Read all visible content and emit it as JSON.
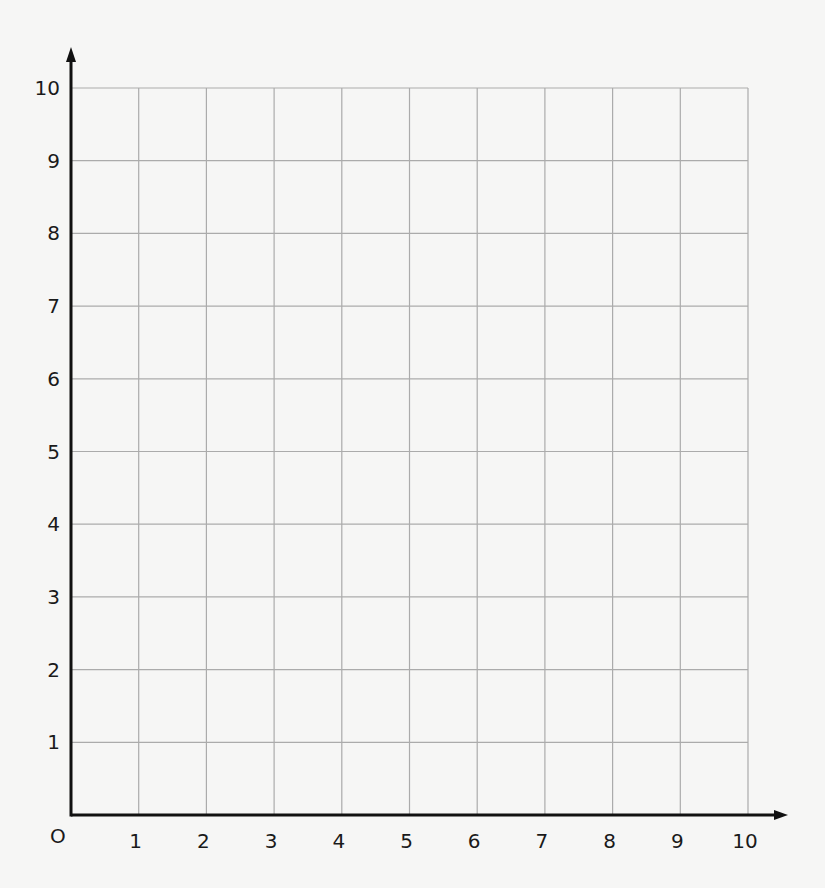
{
  "chart_data": {
    "type": "scatter",
    "title": "",
    "xlabel": "",
    "ylabel": "",
    "origin_label": "O",
    "xlim": [
      0,
      10
    ],
    "ylim": [
      0,
      10
    ],
    "grid": true,
    "x_ticks": [
      "1",
      "2",
      "3",
      "4",
      "5",
      "6",
      "7",
      "8",
      "9",
      "10"
    ],
    "y_ticks": [
      "1",
      "2",
      "3",
      "4",
      "5",
      "6",
      "7",
      "8",
      "9",
      "10"
    ],
    "series": [],
    "legend": null
  },
  "colors": {
    "background": "#f6f6f5",
    "grid": "#ababab",
    "axis": "#111111",
    "text": "#1a1a1a"
  }
}
